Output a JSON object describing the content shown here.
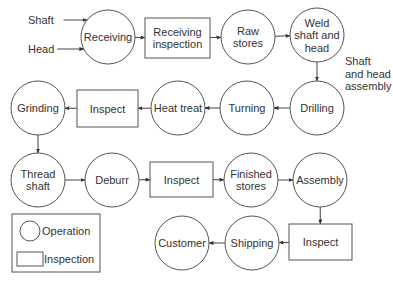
{
  "inputs": [
    {
      "id": "shaft",
      "label": "Shaft",
      "x": 28,
      "y": 20
    },
    {
      "id": "head",
      "label": "Head",
      "x": 28,
      "y": 49
    }
  ],
  "nodes": [
    {
      "id": "receiving",
      "type": "operation",
      "lines": [
        "Receiving"
      ],
      "cx": 108,
      "cy": 37
    },
    {
      "id": "receiving-inspection",
      "type": "inspection",
      "lines": [
        "Receiving",
        "inspection"
      ],
      "x": 145,
      "y": 18,
      "w": 65,
      "h": 40
    },
    {
      "id": "raw-stores",
      "type": "operation",
      "lines": [
        "Raw",
        "stores"
      ],
      "cx": 248,
      "cy": 37
    },
    {
      "id": "weld-shaft-and-head",
      "type": "operation",
      "lines": [
        "Weld",
        "shaft and",
        "head"
      ],
      "cx": 317,
      "cy": 35
    },
    {
      "id": "drilling",
      "type": "operation",
      "lines": [
        "Drilling"
      ],
      "cx": 317,
      "cy": 108
    },
    {
      "id": "turning",
      "type": "operation",
      "lines": [
        "Turning"
      ],
      "cx": 247,
      "cy": 108
    },
    {
      "id": "heat-treat",
      "type": "operation",
      "lines": [
        "Heat treat"
      ],
      "cx": 178,
      "cy": 108
    },
    {
      "id": "inspect-1",
      "type": "inspection",
      "lines": [
        "Inspect"
      ],
      "x": 77,
      "y": 90,
      "w": 61,
      "h": 37
    },
    {
      "id": "grinding",
      "type": "operation",
      "lines": [
        "Grinding"
      ],
      "cx": 38,
      "cy": 108
    },
    {
      "id": "thread-shaft",
      "type": "operation",
      "lines": [
        "Thread",
        "shaft"
      ],
      "cx": 38,
      "cy": 180
    },
    {
      "id": "deburr",
      "type": "operation",
      "lines": [
        "Deburr"
      ],
      "cx": 112,
      "cy": 180
    },
    {
      "id": "inspect-2",
      "type": "inspection",
      "lines": [
        "Inspect"
      ],
      "x": 150,
      "y": 162,
      "w": 63,
      "h": 35
    },
    {
      "id": "finished-stores",
      "type": "operation",
      "lines": [
        "Finished",
        "stores"
      ],
      "cx": 251,
      "cy": 180
    },
    {
      "id": "assembly",
      "type": "operation",
      "lines": [
        "Assembly"
      ],
      "cx": 320,
      "cy": 180
    },
    {
      "id": "inspect-3",
      "type": "inspection",
      "lines": [
        "Inspect"
      ],
      "x": 289,
      "y": 224,
      "w": 63,
      "h": 36
    },
    {
      "id": "shipping",
      "type": "operation",
      "lines": [
        "Shipping"
      ],
      "cx": 252,
      "cy": 243
    },
    {
      "id": "customer",
      "type": "operation",
      "lines": [
        "Customer"
      ],
      "cx": 182,
      "cy": 243
    }
  ],
  "node_radius": 27,
  "edges": [
    {
      "from": "shaft",
      "to": "receiving"
    },
    {
      "from": "head",
      "to": "receiving"
    },
    {
      "from": "receiving",
      "to": "receiving-inspection"
    },
    {
      "from": "receiving-inspection",
      "to": "raw-stores"
    },
    {
      "from": "raw-stores",
      "to": "weld-shaft-and-head"
    },
    {
      "from": "weld-shaft-and-head",
      "to": "drilling",
      "label": [
        "Shaft",
        "and head",
        "assembly"
      ]
    },
    {
      "from": "drilling",
      "to": "turning"
    },
    {
      "from": "turning",
      "to": "heat-treat"
    },
    {
      "from": "heat-treat",
      "to": "inspect-1"
    },
    {
      "from": "inspect-1",
      "to": "grinding"
    },
    {
      "from": "grinding",
      "to": "thread-shaft"
    },
    {
      "from": "thread-shaft",
      "to": "deburr"
    },
    {
      "from": "deburr",
      "to": "inspect-2"
    },
    {
      "from": "inspect-2",
      "to": "finished-stores"
    },
    {
      "from": "finished-stores",
      "to": "assembly"
    },
    {
      "from": "assembly",
      "to": "inspect-3"
    },
    {
      "from": "inspect-3",
      "to": "shipping"
    },
    {
      "from": "shipping",
      "to": "customer"
    }
  ],
  "edge_label": {
    "lines": [
      "Shaft",
      "and head",
      "assembly"
    ],
    "x": 345,
    "y": 65
  },
  "legend": {
    "operation_label": "Operation",
    "inspection_label": "Inspection"
  },
  "colors": {
    "stroke": "#555555",
    "text": "#333333",
    "background": "#ffffff"
  }
}
